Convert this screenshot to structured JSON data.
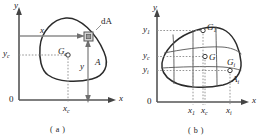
{
  "figure": {
    "panel_a": {
      "caption": "( a )",
      "axis_x_label": "x",
      "axis_y_label": "y",
      "origin_label": "0",
      "labels": {
        "dA": "dA",
        "area": "A",
        "x_distance": "x",
        "y_distance": "y",
        "centroid": "G",
        "centroid_sub": "c",
        "x_centroid": "x",
        "x_centroid_sub": "c",
        "y_centroid": "y",
        "y_centroid_sub": "c"
      }
    },
    "panel_b": {
      "caption": "( b )",
      "axis_x_label": "x",
      "axis_y_label": "y",
      "origin_label": "0",
      "labels": {
        "centroid_1": "G",
        "centroid_1_sub": "1",
        "centroid_total": "G",
        "centroid_i": "G",
        "centroid_i_sub": "i",
        "area_i": "A",
        "area_i_sub": "i",
        "y1": "y",
        "y1_sub": "1",
        "yc": "y",
        "yc_sub": "c",
        "yi": "y",
        "yi_sub": "i",
        "x1": "x",
        "x1_sub": "1",
        "xc": "x",
        "xc_sub": "c",
        "xi": "x",
        "xi_sub": "i"
      }
    },
    "colors": {
      "outline": "#2b2b2b",
      "axis": "#555555",
      "dashed": "#888888",
      "arrow": "#777777",
      "subdivision": "#555555",
      "marker_fill": "#ffffff"
    }
  }
}
